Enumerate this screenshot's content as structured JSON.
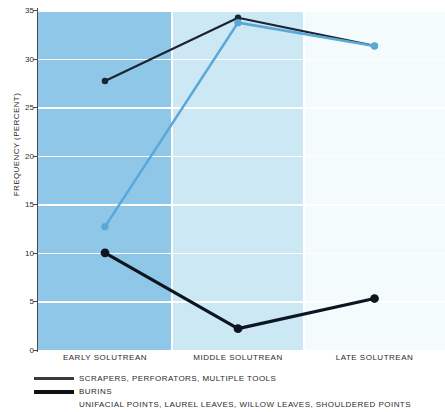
{
  "chart_data": {
    "type": "line",
    "title": "",
    "subtitle": "",
    "xlabel": "",
    "ylabel": "FREQUENCY (PERCENT)",
    "categories": [
      "EARLY SOLUTREAN",
      "MIDDLE SOLUTREAN",
      "LATE SOLUTREAN"
    ],
    "ylim": [
      0,
      35
    ],
    "yticks": [
      0,
      5,
      10,
      15,
      20,
      25,
      30,
      35
    ],
    "ytick_labels": [
      "0",
      "5",
      "10",
      "15",
      "20",
      "25",
      "30",
      "35"
    ],
    "grid": true,
    "legend_position": "below",
    "series": [
      {
        "name": "SCRAPERS, PERFORATORS, MULTIPLE TOOLS",
        "color": "#1b2430",
        "values": [
          27.7,
          34.2,
          31.3
        ],
        "marker": "circle",
        "linewidth": 2.2
      },
      {
        "name": "BURINS",
        "color": "#0d1520",
        "values": [
          10.0,
          2.2,
          5.3
        ],
        "marker": "circle",
        "linewidth": 3.2
      },
      {
        "name": "UNIFACIAL POINTS, LAUREL LEAVES, WILLOW LEAVES, SHOULDERED POINTS",
        "color": "#5ba8d8",
        "values": [
          12.7,
          33.7,
          31.3
        ],
        "marker": "circle",
        "linewidth": 2.6
      }
    ],
    "background_bands": [
      {
        "label": "EARLY SOLUTREAN",
        "color": "#8ec7e8"
      },
      {
        "label": "MIDDLE SOLUTREAN",
        "color": "#cbe8f4"
      },
      {
        "label": "LATE SOLUTREAN",
        "color": "#f4fbfd"
      }
    ],
    "gridline_color": "#ffffff",
    "axis_color": "#4a4a4a"
  },
  "legend": {
    "entries": [
      {
        "label": "SCRAPERS, PERFORATORS, MULTIPLE TOOLS",
        "swatch": "thin",
        "color": "#3a3a3a"
      },
      {
        "label": "BURINS",
        "swatch": "thick",
        "color": "#111111"
      },
      {
        "label": "UNIFACIAL POINTS, LAUREL LEAVES, WILLOW LEAVES, SHOULDERED POINTS",
        "swatch": "none",
        "color": "#5ba8d8"
      }
    ]
  }
}
